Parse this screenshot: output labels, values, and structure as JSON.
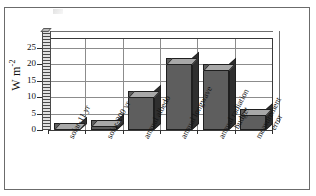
{
  "figure": {
    "frame_border_color": "#6b6b6b",
    "background_color": "#ffffff"
  },
  "chart_data": {
    "type": "bar",
    "title": "",
    "subtitle": "",
    "xlabel": "",
    "ylabel": "W m-2",
    "ylabel_display": "W m",
    "ylabel_exponent": "-2",
    "categories": [
      "solar-11 yr",
      "solar-200 yr",
      "annual albedo",
      "annual longwave",
      "annual radiation\nbudget",
      "measurement\nerror"
    ],
    "category_lines": [
      [
        "solar-11 yr"
      ],
      [
        "solar-200 yr"
      ],
      [
        "annual albedo"
      ],
      [
        "annual longwave"
      ],
      [
        "annual radiation",
        "budget"
      ],
      [
        "measurement",
        "error"
      ]
    ],
    "values": [
      2,
      3,
      12,
      22,
      20,
      6.5
    ],
    "ylim": [
      0,
      28
    ],
    "yticks": [
      0,
      5,
      10,
      15,
      20,
      25
    ],
    "ytick_labels": [
      "0",
      "5",
      "10",
      "15",
      "20",
      "25"
    ],
    "grid": true,
    "grid_horizontal": true,
    "grid_vertical": true,
    "legend": "none",
    "style": "3d-bar",
    "bar_face_color": "#5e5e5e",
    "bar_top_color": "#a8a8a8",
    "bar_side_color": "#2f2f2f",
    "grid_color": "#8c8c8c",
    "axis_color": "#2e2e2e"
  }
}
